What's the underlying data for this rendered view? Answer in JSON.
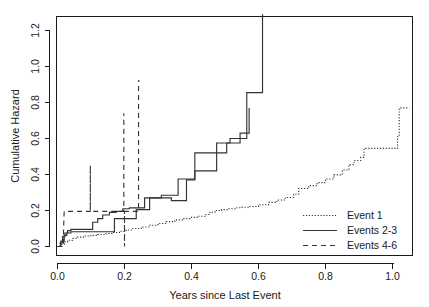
{
  "chart_data": {
    "type": "line",
    "title": "",
    "xlabel": "Years since Last Event",
    "ylabel": "Cumulative Hazard",
    "xlim": [
      -0.035,
      1.06
    ],
    "ylim": [
      -0.035,
      1.33
    ],
    "xticks": [
      0.0,
      0.2,
      0.4,
      0.6,
      0.8,
      1.0
    ],
    "xtick_labels": [
      "0.0",
      "0.2",
      "0.4",
      "0.6",
      "0.8",
      "1.0"
    ],
    "yticks": [
      0.0,
      0.2,
      0.4,
      0.6,
      0.8,
      1.0,
      1.2
    ],
    "ytick_labels": [
      "0.0",
      "0.2",
      "0.4",
      "0.6",
      "0.8",
      "1.0",
      "1.2"
    ],
    "grid": false,
    "legend_position": "bottom-right",
    "step_type": "post",
    "series": [
      {
        "name": "Event 1",
        "style": "dotted",
        "color": "#333333",
        "x": [
          0.0,
          0.012,
          0.02,
          0.03,
          0.045,
          0.06,
          0.08,
          0.1,
          0.12,
          0.145,
          0.165,
          0.185,
          0.205,
          0.225,
          0.25,
          0.275,
          0.3,
          0.325,
          0.35,
          0.375,
          0.4,
          0.42,
          0.44,
          0.455,
          0.47,
          0.49,
          0.51,
          0.53,
          0.55,
          0.57,
          0.6,
          0.63,
          0.655,
          0.68,
          0.705,
          0.72,
          0.75,
          0.775,
          0.8,
          0.825,
          0.85,
          0.87,
          0.885,
          0.905,
          0.915,
          1.015,
          1.02,
          1.05
        ],
        "y": [
          0.0,
          0.012,
          0.025,
          0.035,
          0.045,
          0.052,
          0.058,
          0.062,
          0.067,
          0.072,
          0.078,
          0.085,
          0.092,
          0.1,
          0.108,
          0.118,
          0.128,
          0.138,
          0.148,
          0.155,
          0.162,
          0.168,
          0.178,
          0.19,
          0.2,
          0.205,
          0.21,
          0.215,
          0.218,
          0.222,
          0.232,
          0.245,
          0.258,
          0.272,
          0.29,
          0.322,
          0.338,
          0.355,
          0.375,
          0.398,
          0.425,
          0.455,
          0.478,
          0.495,
          0.545,
          0.61,
          0.77,
          0.77
        ]
      },
      {
        "name": "Events 2-3",
        "style": "solid",
        "color": "#333333",
        "comment": "two overlapping solid step curves drawn as one series group",
        "x": [
          0.0,
          0.008,
          0.015,
          0.022,
          0.03,
          0.04,
          0.055,
          0.075,
          0.09,
          0.105,
          0.12,
          0.135,
          0.155,
          0.175,
          0.195,
          0.215,
          0.24,
          0.26,
          0.285,
          0.31,
          0.335,
          0.36,
          0.395,
          0.41,
          0.44,
          0.475,
          0.5,
          0.515,
          0.55,
          0.565,
          0.605,
          0.612
        ],
        "y": [
          0.0,
          0.02,
          0.055,
          0.075,
          0.088,
          0.095,
          0.095,
          0.095,
          0.095,
          0.135,
          0.155,
          0.175,
          0.19,
          0.195,
          0.21,
          0.215,
          0.215,
          0.27,
          0.27,
          0.285,
          0.285,
          0.375,
          0.375,
          0.42,
          0.42,
          0.575,
          0.575,
          0.6,
          0.6,
          0.855,
          0.855,
          1.29
        ]
      },
      {
        "name": "Events 2-3 (second)",
        "style": "solid",
        "color": "#333333",
        "x": [
          0.0,
          0.01,
          0.02,
          0.028,
          0.04,
          0.06,
          0.085,
          0.105,
          0.125,
          0.15,
          0.17,
          0.19,
          0.21,
          0.235,
          0.255,
          0.275,
          0.305,
          0.34,
          0.355,
          0.385,
          0.41,
          0.44,
          0.47,
          0.505,
          0.52,
          0.545,
          0.565,
          0.572
        ],
        "y": [
          0.0,
          0.03,
          0.062,
          0.075,
          0.082,
          0.082,
          0.082,
          0.082,
          0.082,
          0.082,
          0.155,
          0.155,
          0.155,
          0.205,
          0.205,
          0.27,
          0.27,
          0.255,
          0.255,
          0.37,
          0.52,
          0.52,
          0.52,
          0.575,
          0.575,
          0.63,
          0.63,
          0.77
        ]
      },
      {
        "name": "Events 4-6",
        "style": "dashed",
        "color": "#333333",
        "x": [
          0.0,
          0.018,
          0.018,
          0.02,
          0.098,
          0.098,
          0.098,
          0.1,
          0.198,
          0.198,
          0.198,
          0.2,
          0.2,
          0.2,
          0.242,
          0.242,
          0.245
        ],
        "y": [
          0.0,
          0.0,
          0.09,
          0.195,
          0.195,
          0.45,
          0.195,
          0.195,
          0.195,
          0.74,
          0.195,
          0.195,
          0.0,
          0.195,
          0.195,
          0.92,
          0.92
        ]
      }
    ],
    "legend_entries": [
      {
        "label": "Event 1",
        "style": "dotted"
      },
      {
        "label": "Events 2-3",
        "style": "solid"
      },
      {
        "label": "Events 4-6",
        "style": "dashed"
      }
    ],
    "annotations": []
  }
}
